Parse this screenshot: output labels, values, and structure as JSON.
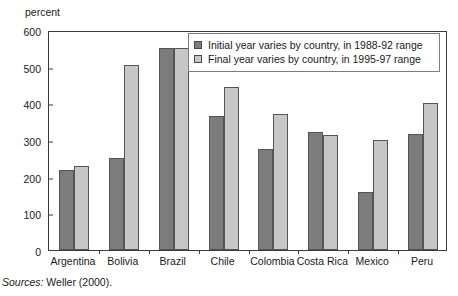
{
  "chart_data": {
    "type": "bar",
    "title": "",
    "xlabel": "",
    "ylabel": "percent",
    "ylim": [
      0,
      600
    ],
    "yticks": [
      0,
      100,
      200,
      300,
      400,
      500,
      600
    ],
    "grid": false,
    "legend_position": "top-right-inside",
    "categories": [
      "Argentina",
      "Bolivia",
      "Brazil",
      "Chile",
      "Colombia",
      "Costa Rica",
      "Mexico",
      "Peru"
    ],
    "series": [
      {
        "name": "Initial year varies by country, in 1988-92 range",
        "color": "#7c7c7c",
        "values": [
          218,
          250,
          552,
          365,
          275,
          322,
          158,
          317
        ]
      },
      {
        "name": "Final year varies by country, in 1995-97 range",
        "color": "#c6c6c6",
        "values": [
          228,
          505,
          552,
          445,
          370,
          313,
          300,
          400
        ]
      }
    ]
  },
  "axis": {
    "y_title": "percent",
    "y_tick_labels": [
      "600",
      "500",
      "400",
      "300",
      "200",
      "100",
      "0"
    ]
  },
  "legend": {
    "items": [
      {
        "label": "Initial year varies by country, in 1988-92 range"
      },
      {
        "label": "Final year varies by country, in 1995-97 range"
      }
    ]
  },
  "footer": {
    "source_label": "Sources:",
    "source_text": " Weller (2000)."
  }
}
